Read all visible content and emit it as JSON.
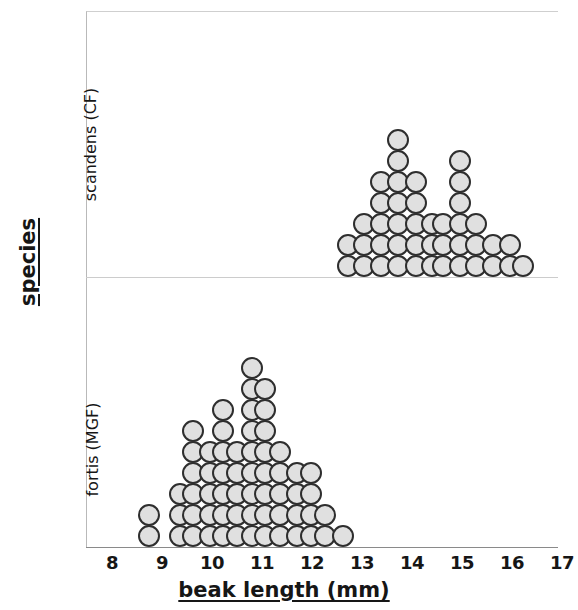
{
  "figure": {
    "title": "",
    "x_axis_label": "beak length (mm)",
    "y_axis_label": "species"
  },
  "axes": {
    "x_ticks": [
      "8",
      "9",
      "10",
      "11",
      "12",
      "13",
      "14",
      "15",
      "16",
      "17"
    ],
    "x_tick_values": [
      8,
      9,
      10,
      11,
      12,
      13,
      14,
      15,
      16,
      17
    ],
    "y_panels": [
      "scandens (CF)",
      "fortis (MGF)"
    ]
  },
  "style": {
    "dot_fill": "#e0e0e0",
    "dot_stroke": "#2e2e2e",
    "axis_color": "#8a8a8a",
    "divider_color": "#cccccc",
    "text_color": "#161616",
    "background": "#ffffff"
  },
  "chart_data": {
    "type": "scatter",
    "subtype": "stacked-dot-plot",
    "title": "",
    "xlabel": "beak length (mm)",
    "ylabel": "species",
    "xlim": [
      7.5,
      17.5
    ],
    "grid": false,
    "legend": "none",
    "dot_diameter_px": 22,
    "panels": [
      {
        "name": "scandens (CF)",
        "label": "scandens (CF)",
        "n": 47,
        "bins": [
          {
            "x": 12.72,
            "count": 2
          },
          {
            "x": 13.04,
            "count": 3
          },
          {
            "x": 13.38,
            "count": 5
          },
          {
            "x": 13.72,
            "count": 7
          },
          {
            "x": 14.08,
            "count": 5
          },
          {
            "x": 14.4,
            "count": 3
          },
          {
            "x": 14.62,
            "count": 3
          },
          {
            "x": 14.95,
            "count": 6
          },
          {
            "x": 15.28,
            "count": 3
          },
          {
            "x": 15.62,
            "count": 2
          },
          {
            "x": 15.95,
            "count": 2
          },
          {
            "x": 16.22,
            "count": 1
          }
        ]
      },
      {
        "name": "fortis (MGF)",
        "label": "fortis (MGF)",
        "n": 62,
        "bins": [
          {
            "x": 8.74,
            "count": 2
          },
          {
            "x": 9.35,
            "count": 3
          },
          {
            "x": 9.62,
            "count": 6
          },
          {
            "x": 9.95,
            "count": 5
          },
          {
            "x": 10.22,
            "count": 7
          },
          {
            "x": 10.5,
            "count": 5
          },
          {
            "x": 10.8,
            "count": 9
          },
          {
            "x": 11.05,
            "count": 8
          },
          {
            "x": 11.35,
            "count": 5
          },
          {
            "x": 11.7,
            "count": 4
          },
          {
            "x": 11.98,
            "count": 4
          },
          {
            "x": 12.25,
            "count": 2
          },
          {
            "x": 12.62,
            "count": 1
          }
        ]
      }
    ]
  }
}
